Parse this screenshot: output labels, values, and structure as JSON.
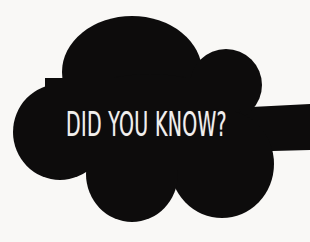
{
  "graphic": {
    "type": "speech-bubble-callout",
    "shape_name": "cloud-callout",
    "background_color": "#f9f8f6",
    "bubble_color": "#0d0c0c",
    "text_color": "#f2f0ee"
  },
  "callout": {
    "headline": "DID YOU KNOW?"
  }
}
